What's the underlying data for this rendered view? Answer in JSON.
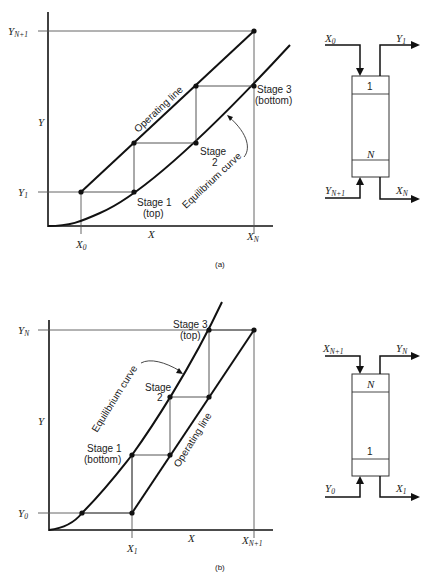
{
  "figure_a": {
    "caption": "(a)",
    "axis": {
      "x_label": "X",
      "y_label": "Y"
    },
    "ticks": {
      "y_top": {
        "base": "Y",
        "sub": "N+1"
      },
      "y_bottom": {
        "base": "Y",
        "sub": "1"
      },
      "x_left": {
        "base": "X",
        "sub": "0"
      },
      "x_right": {
        "base": "X",
        "sub": "N"
      }
    },
    "curves": {
      "operating_line": "Operating line",
      "equilibrium_curve": "Equilibrium curve"
    },
    "stages": [
      {
        "name": "Stage 1",
        "note": "(top)"
      },
      {
        "name": "Stage",
        "note": "2"
      },
      {
        "name": "Stage 3",
        "note": "(bottom)"
      }
    ],
    "column": {
      "top_stage": "1",
      "bottom_stage": "N",
      "streams": {
        "in_top": {
          "base": "X",
          "sub": "0"
        },
        "out_top": {
          "base": "Y",
          "sub": "1"
        },
        "in_bottom": {
          "base": "Y",
          "sub": "N+1"
        },
        "out_bottom": {
          "base": "X",
          "sub": "N"
        }
      }
    }
  },
  "figure_b": {
    "caption": "(b)",
    "axis": {
      "x_label": "X",
      "y_label": "Y"
    },
    "ticks": {
      "y_top": {
        "base": "Y",
        "sub": "N"
      },
      "y_bottom": {
        "base": "Y",
        "sub": "0"
      },
      "x_left": {
        "base": "X",
        "sub": "1"
      },
      "x_right": {
        "base": "X",
        "sub": "N+1"
      }
    },
    "curves": {
      "operating_line": "Operating line",
      "equilibrium_curve": "Equilibrium curve"
    },
    "stages": [
      {
        "name": "Stage 1",
        "note": "(bottom)"
      },
      {
        "name": "Stage",
        "note": "2"
      },
      {
        "name": "Stage 3",
        "note": "(top)"
      }
    ],
    "column": {
      "top_stage": "N",
      "bottom_stage": "1",
      "streams": {
        "in_top": {
          "base": "X",
          "sub": "N+1"
        },
        "out_top": {
          "base": "Y",
          "sub": "N"
        },
        "in_bottom": {
          "base": "Y",
          "sub": "0"
        },
        "out_bottom": {
          "base": "X",
          "sub": "1"
        }
      }
    }
  }
}
